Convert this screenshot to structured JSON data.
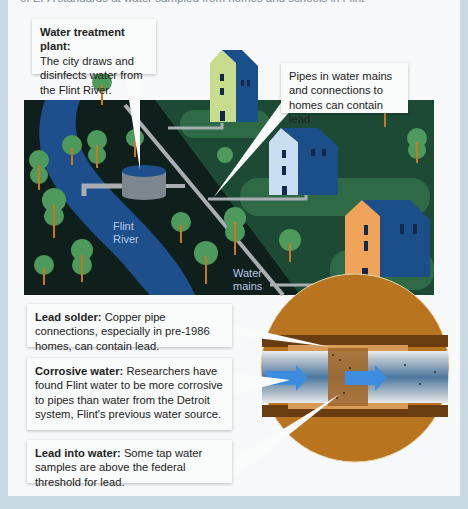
{
  "top_text": "of EPA standards at water sampled from homes and schools in Flint",
  "callouts": {
    "treatment_plant": {
      "title": "Water treatment plant:",
      "body": "The city draws and disinfects water from the Flint River."
    },
    "pipes": {
      "body": "Pipes in water mains and connections to homes can contain lead."
    },
    "lead_solder": {
      "title": "Lead solder:",
      "body": "Copper pipe connections, especially in pre-1986 homes, can contain lead."
    },
    "corrosive_water": {
      "title": "Corrosive water:",
      "body": "Researchers have found Flint water to be more corrosive to pipes than water from the Detroit system, Flint's previous water source."
    },
    "lead_into_water": {
      "title": "Lead into water:",
      "body": "Some tap water samples are above the federal threshold for lead."
    }
  },
  "labels": {
    "river_line1": "Flint",
    "river_line2": "River",
    "mains_line1": "Water",
    "mains_line2": "mains"
  },
  "colors": {
    "ground": "#0f1f1c",
    "river": "#1d4f8c",
    "grass": "#1f5a38",
    "tree": "#4e9a5c",
    "trunk": "#c9781f",
    "pipe": "#a9aeb3",
    "soil": "#b8741f",
    "frame": "#c9dae5"
  }
}
